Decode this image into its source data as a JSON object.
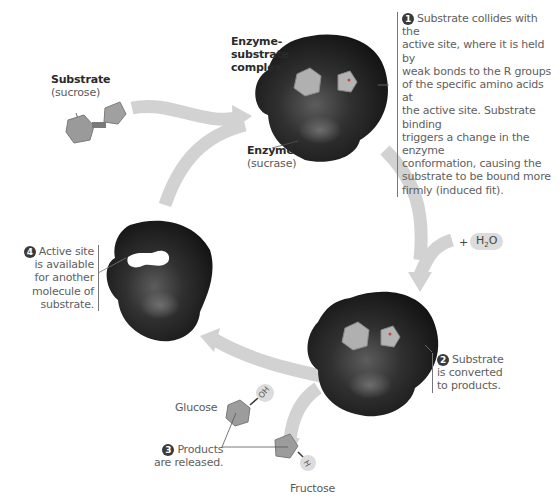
{
  "labels": {
    "substrate": {
      "title": "Substrate",
      "subtitle": "(sucrose)"
    },
    "complex": {
      "line1": "Enzyme-",
      "line2": "substrate",
      "line3": "complex"
    },
    "enzyme": {
      "title": "Enzyme",
      "subtitle": "(sucrase)"
    },
    "water": {
      "plus": "+",
      "formula_h": "H",
      "formula_sub": "2",
      "formula_o": "O"
    },
    "glucose": "Glucose",
    "fructose": "Fructose",
    "oh": "OH",
    "h": "H"
  },
  "steps": [
    {
      "number": "1",
      "lines": [
        "Substrate collides with the",
        "active site, where it is held by",
        "weak bonds to the R groups",
        "of the specific amino acids at",
        "the active site. Substrate binding",
        "triggers a change in the enzyme",
        "conformation, causing the",
        "substrate to be bound more",
        "firmly (induced fit)."
      ]
    },
    {
      "number": "2",
      "lines": [
        "Substrate",
        "is converted",
        "to products."
      ]
    },
    {
      "number": "3",
      "lines": [
        "Products",
        "are released."
      ]
    },
    {
      "number": "4",
      "lines": [
        "Active site",
        "is available",
        "for another",
        "molecule of",
        "substrate."
      ]
    }
  ],
  "colors": {
    "arrow": "#d2d2d2",
    "enzyme_dark": "#1c1c1c",
    "enzyme_light": "#6a6a6a",
    "molecule": "#a8a8a8",
    "text": "#5a5a5a",
    "number_badge": "#3a3a3a"
  }
}
